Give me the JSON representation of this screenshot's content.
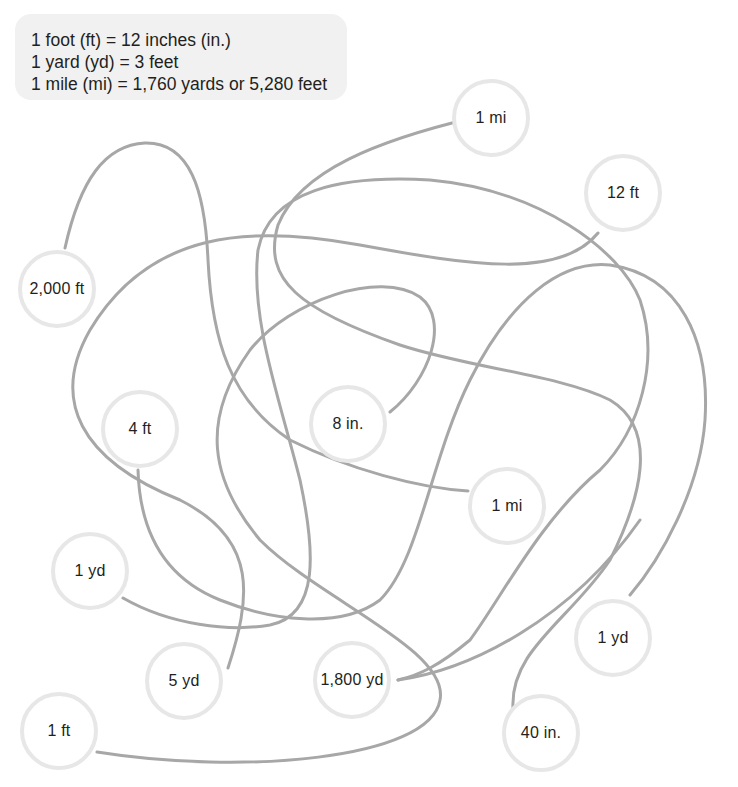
{
  "reference": {
    "lines": [
      "1 foot (ft) = 12 inches (in.)",
      "1 yard (yd) = 3 feet",
      "1 mile (mi) = 1,760 yards or 5,280 feet"
    ]
  },
  "colors": {
    "path_stroke": "#a7a7a7",
    "circle_border": "#e7e7e7",
    "reference_bg": "#f1f1f1",
    "text": "#231f20"
  },
  "nodes": [
    {
      "id": "n1",
      "label": "1 mi",
      "x": 491,
      "y": 118
    },
    {
      "id": "n2",
      "label": "12 ft",
      "x": 623,
      "y": 193
    },
    {
      "id": "n3",
      "label": "2,000 ft",
      "x": 57,
      "y": 289
    },
    {
      "id": "n4",
      "label": "4 ft",
      "x": 140,
      "y": 429
    },
    {
      "id": "n5",
      "label": "8 in.",
      "x": 348,
      "y": 424
    },
    {
      "id": "n6",
      "label": "1 mi",
      "x": 507,
      "y": 506
    },
    {
      "id": "n7",
      "label": "1 yd",
      "x": 90,
      "y": 571
    },
    {
      "id": "n8",
      "label": "1 yd",
      "x": 613,
      "y": 638
    },
    {
      "id": "n9",
      "label": "5 yd",
      "x": 184,
      "y": 681
    },
    {
      "id": "n10",
      "label": "1,800 yd",
      "x": 352,
      "y": 680
    },
    {
      "id": "n11",
      "label": "1 ft",
      "x": 59,
      "y": 731
    },
    {
      "id": "n12",
      "label": "40 in.",
      "x": 541,
      "y": 733
    }
  ],
  "paths": [
    {
      "id": "p1",
      "d": "M65,248 C80,180 105,145 145,143 C190,142 205,190 208,260 C212,340 230,400 290,440 C350,470 420,488 468,491"
    },
    {
      "id": "p2",
      "d": "M472,118 C380,140 300,170 278,225 C262,280 300,310 400,345 C470,368 560,375 610,400 C660,430 640,500 610,560 C570,620 510,650 513,708"
    },
    {
      "id": "p3",
      "d": "M598,233 C560,280 470,265 360,245 C250,225 150,230 90,330 C50,400 80,460 180,500 C260,540 250,600 228,668"
    },
    {
      "id": "p4",
      "d": "M390,412 C430,380 450,320 420,297 C380,270 290,300 250,350 C200,420 210,480 260,540 C320,600 450,650 440,700 C430,760 240,775 97,752"
    },
    {
      "id": "p5",
      "d": "M123,598 C170,625 230,632 270,625 C320,615 315,550 300,480 C280,400 250,320 258,250 C270,190 340,175 430,180 C540,190 620,250 640,300 C660,360 640,430 600,470 C540,520 500,600 470,640 C440,665 420,675 398,680"
    },
    {
      "id": "p6",
      "d": "M138,470 C140,540 170,580 220,600 C270,620 340,630 380,600 C420,560 430,460 470,380 C510,300 560,260 610,265 C680,275 710,340 705,420 C700,490 660,560 630,595"
    },
    {
      "id": "p7",
      "d": "M398,680 C470,670 570,620 640,520"
    }
  ]
}
